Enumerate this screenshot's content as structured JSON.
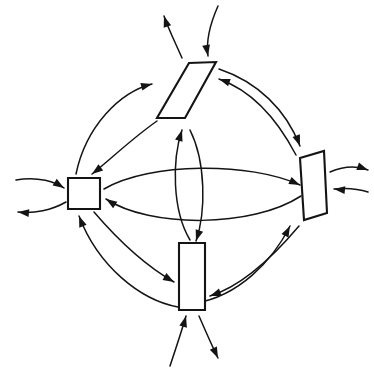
{
  "diagram": {
    "style": "hand-drawn line art",
    "background_color": "#ffffff",
    "line_color": "#141414",
    "node_fill_color": "#ffffff",
    "node_stroke_width": 2.1,
    "link_stroke_width": 1.5,
    "canvas": {
      "width": 374,
      "height": 374
    },
    "nodes": [
      {
        "id": "left-node",
        "name": "left-square-node",
        "shape": "square",
        "label": "",
        "position": "west",
        "center": {
          "x": 84,
          "y": 193
        },
        "points": "68,178 100,178 100,209 68,209"
      },
      {
        "id": "top-node",
        "name": "top-parallelogram-node",
        "shape": "parallelogram",
        "label": "",
        "position": "north",
        "center": {
          "x": 187,
          "y": 90
        },
        "points": "189,63 216,62 185,118 157,118"
      },
      {
        "id": "right-node",
        "name": "right-parallelogram-node",
        "shape": "parallelogram",
        "label": "",
        "position": "east",
        "center": {
          "x": 314,
          "y": 186
        },
        "points": "300,158 324,151 327,213 304,220"
      },
      {
        "id": "bottom-node",
        "name": "bottom-rectangle-node",
        "shape": "rectangle",
        "label": "",
        "position": "south",
        "center": {
          "x": 192,
          "y": 277
        },
        "points": "179,243 205,243 205,310 179,310"
      }
    ],
    "internal_links": [
      {
        "id": "link-left-to-right-upper",
        "name": "link-left-to-right",
        "from": "left-node",
        "to": "right-node",
        "direction": "rightward",
        "curve": "arc-bowed-up",
        "path": "M 104 189 C 150 162 250 162 300 185",
        "arrow_at": "end",
        "arrow_angle_deg": 24
      },
      {
        "id": "link-right-to-left-lower",
        "name": "link-right-to-left",
        "from": "right-node",
        "to": "left-node",
        "direction": "leftward",
        "curve": "arc-bowed-down",
        "path": "M 301 196 C 252 228 150 228 106 199",
        "arrow_at": "end",
        "arrow_angle_deg": 213
      },
      {
        "id": "link-bottom-to-top-left",
        "name": "link-bottom-to-top",
        "from": "bottom-node",
        "to": "top-node",
        "direction": "upward",
        "curve": "arc-bowed-left",
        "path": "M 190 240 C 172 210 172 160 182 130",
        "arrow_at": "end",
        "arrow_angle_deg": 287
      },
      {
        "id": "link-top-to-bottom-right",
        "name": "link-top-to-bottom",
        "from": "top-node",
        "to": "bottom-node",
        "direction": "downward",
        "curve": "arc-bowed-right",
        "path": "M 190 130 C 206 162 206 212 196 241",
        "arrow_at": "end",
        "arrow_angle_deg": 108
      },
      {
        "id": "link-left-to-top-outer",
        "name": "link-left-to-top",
        "from": "left-node",
        "to": "top-node",
        "direction": "up-right",
        "curve": "arc-outer",
        "path": "M 76 174 C 86 126 120 92 152 84",
        "arrow_at": "end",
        "arrow_angle_deg": 345
      },
      {
        "id": "link-top-to-left-inner",
        "name": "link-top-to-left",
        "from": "top-node",
        "to": "left-node",
        "direction": "down-left",
        "curve": "arc-inner",
        "path": "M 157 121 C 130 140 110 160 92 174",
        "arrow_at": "end",
        "arrow_angle_deg": 143
      },
      {
        "id": "link-top-to-right-upper",
        "name": "link-top-to-right",
        "from": "top-node",
        "to": "right-node",
        "direction": "down-right",
        "curve": "arc-bowed-up",
        "path": "M 219 69 C 258 82 286 110 300 146",
        "arrow_at": "end",
        "arrow_angle_deg": 70
      },
      {
        "id": "link-right-to-top-lower",
        "name": "link-right-to-top",
        "from": "right-node",
        "to": "top-node",
        "direction": "up-left",
        "curve": "arc-bowed-down",
        "path": "M 296 155 C 275 115 250 90 219 79",
        "arrow_at": "end",
        "arrow_angle_deg": 199
      },
      {
        "id": "link-left-to-bottom-inner",
        "name": "link-left-to-bottom",
        "from": "left-node",
        "to": "bottom-node",
        "direction": "down-right",
        "curve": "arc-inner",
        "path": "M 94 212 C 118 240 146 266 174 282",
        "arrow_at": "end",
        "arrow_angle_deg": 30
      },
      {
        "id": "link-bottom-to-left-outer",
        "name": "link-bottom-to-left",
        "from": "bottom-node",
        "to": "left-node",
        "direction": "up-left",
        "curve": "arc-outer",
        "path": "M 178 307 C 140 300 98 266 79 216",
        "arrow_at": "end",
        "arrow_angle_deg": 249
      },
      {
        "id": "link-bottom-to-right-lower",
        "name": "link-bottom-to-right",
        "from": "bottom-node",
        "to": "right-node",
        "direction": "up-right",
        "curve": "arc-bowed-down",
        "path": "M 196 303 C 238 296 272 262 290 226",
        "arrow_at": "end",
        "arrow_angle_deg": 297
      },
      {
        "id": "link-right-to-bottom-upper",
        "name": "link-right-to-bottom",
        "from": "right-node",
        "to": "bottom-node",
        "direction": "down-left",
        "curve": "arc-bowed-up",
        "path": "M 299 226 C 272 258 242 286 210 296",
        "arrow_at": "end",
        "arrow_angle_deg": 160
      }
    ],
    "external_arrows": [
      {
        "id": "ext-in-left",
        "name": "external-input-left",
        "at": "left-node",
        "kind": "inbound",
        "path": "M 16 180 C 38 176 56 182 64 188",
        "arrow_at": "end",
        "arrow_angle_deg": 32
      },
      {
        "id": "ext-out-left",
        "name": "external-output-left",
        "at": "left-node",
        "kind": "outbound",
        "path": "M 66 202 C 52 210 34 214 18 212",
        "arrow_at": "end",
        "arrow_angle_deg": 186
      },
      {
        "id": "ext-in-top",
        "name": "external-input-top",
        "at": "top-node",
        "kind": "inbound",
        "path": "M 218 6 C 210 24 206 42 208 56",
        "arrow_at": "end",
        "arrow_angle_deg": 80
      },
      {
        "id": "ext-out-top",
        "name": "external-output-top",
        "at": "top-node",
        "kind": "outbound",
        "path": "M 182 58 C 175 42 168 28 164 16",
        "arrow_at": "end",
        "arrow_angle_deg": 252
      },
      {
        "id": "ext-out-right",
        "name": "external-output-right",
        "at": "right-node",
        "kind": "outbound",
        "path": "M 330 172 C 344 166 358 166 368 170",
        "arrow_at": "end",
        "arrow_angle_deg": 20
      },
      {
        "id": "ext-in-right",
        "name": "external-input-right",
        "at": "right-node",
        "kind": "inbound",
        "path": "M 368 192 C 356 188 344 188 334 189",
        "arrow_at": "end",
        "arrow_angle_deg": 186
      },
      {
        "id": "ext-in-bottom",
        "name": "external-input-bottom",
        "at": "bottom-node",
        "kind": "inbound",
        "path": "M 170 366 C 176 348 182 330 186 316",
        "arrow_at": "end",
        "arrow_angle_deg": 285
      },
      {
        "id": "ext-out-bottom",
        "name": "external-output-bottom",
        "at": "bottom-node",
        "kind": "outbound",
        "path": "M 199 316 C 206 332 212 346 218 358",
        "arrow_at": "end",
        "arrow_angle_deg": 65
      }
    ]
  }
}
